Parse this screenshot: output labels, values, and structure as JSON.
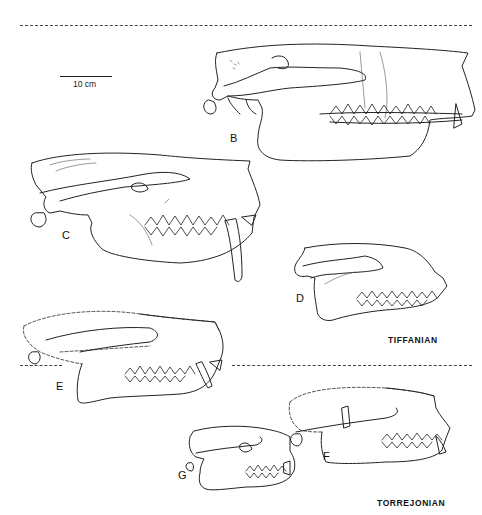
{
  "figure": {
    "scale_bar": {
      "label": "10 cm"
    },
    "periods": [
      {
        "id": "tiffanian",
        "label": "TIFFANIAN"
      },
      {
        "id": "torrejonian",
        "label": "TORREJONIAN"
      }
    ],
    "specimens": [
      {
        "id": "B",
        "label": "B",
        "period": "TIFFANIAN"
      },
      {
        "id": "C",
        "label": "C",
        "period": "TIFFANIAN"
      },
      {
        "id": "D",
        "label": "D",
        "period": "TIFFANIAN"
      },
      {
        "id": "E",
        "label": "E",
        "period": "TIFFANIAN"
      },
      {
        "id": "F",
        "label": "F",
        "period": "TORREJONIAN"
      },
      {
        "id": "G",
        "label": "G",
        "period": "TORREJONIAN"
      }
    ]
  }
}
